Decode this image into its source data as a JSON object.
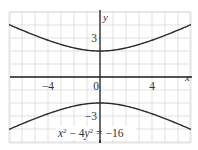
{
  "chart_data": {
    "type": "line",
    "title": "",
    "equation": "x² − 4y² = −16",
    "equation_parts": {
      "a": "x",
      "b": " − 4",
      "c": "y",
      "d": " = −16",
      "exp": "2"
    },
    "xlabel": "x",
    "ylabel": "y",
    "xlim": [
      -7,
      7
    ],
    "ylim": [
      -5,
      5
    ],
    "grid": true,
    "grid_step": 1,
    "x_ticks": [
      {
        "value": -4,
        "label": "−4"
      },
      {
        "value": 0,
        "label": "0"
      },
      {
        "value": 4,
        "label": "4"
      }
    ],
    "y_ticks": [
      {
        "value": 3,
        "label": "3"
      },
      {
        "value": -3,
        "label": "−3"
      }
    ],
    "series": [
      {
        "name": "upper branch",
        "function": "y = sqrt((x^2+16)/4)",
        "x": [
          -7,
          -6,
          -5,
          -4,
          -3,
          -2,
          -1,
          0,
          1,
          2,
          3,
          4,
          5,
          6,
          7
        ],
        "values": [
          4.03,
          3.61,
          3.2,
          2.83,
          2.5,
          2.24,
          2.06,
          2.0,
          2.06,
          2.24,
          2.5,
          2.83,
          3.2,
          3.61,
          4.03
        ]
      },
      {
        "name": "lower branch",
        "function": "y = -sqrt((x^2+16)/4)",
        "x": [
          -7,
          -6,
          -5,
          -4,
          -3,
          -2,
          -1,
          0,
          1,
          2,
          3,
          4,
          5,
          6,
          7
        ],
        "values": [
          -4.03,
          -3.61,
          -3.2,
          -2.83,
          -2.5,
          -2.24,
          -2.06,
          -2.0,
          -2.06,
          -2.24,
          -2.5,
          -2.83,
          -3.2,
          -3.61,
          -4.03
        ]
      }
    ],
    "colors": {
      "curve": "#2a2a2a",
      "axis": "#1a1a1a",
      "grid": "#d9d9d9",
      "text": "#333333"
    }
  }
}
